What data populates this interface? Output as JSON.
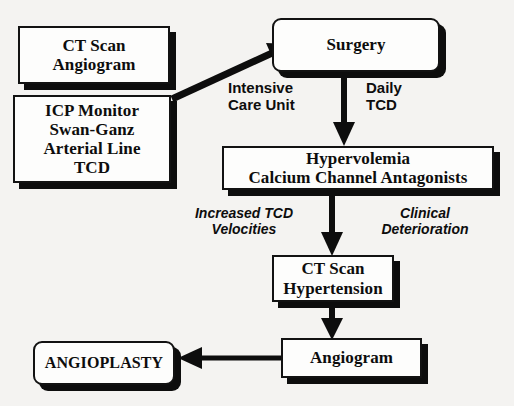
{
  "diagram": {
    "type": "flowchart",
    "background_color": "#f4f3f1",
    "ink_color": "#0d0d0d",
    "box_fill_color": "#fdfdfc"
  },
  "nodes": [
    {
      "id": "ct-scan-angiogram",
      "text": "CT Scan\nAngiogram",
      "shape": "rect",
      "font_size": 17
    },
    {
      "id": "icp-monitor",
      "text": "ICP Monitor\nSwan-Ganz\nArterial Line\nTCD",
      "shape": "rect",
      "font_size": 17
    },
    {
      "id": "surgery",
      "text": "Surgery",
      "shape": "rounded-rect",
      "font_size": 17
    },
    {
      "id": "hypervolemia",
      "text": "Hypervolemia\nCalcium Channel Antagonists",
      "shape": "rect",
      "font_size": 17
    },
    {
      "id": "ct-scan-hypertension",
      "text": "CT Scan\nHypertension",
      "shape": "rect",
      "font_size": 17
    },
    {
      "id": "angiogram",
      "text": "Angiogram",
      "shape": "rect",
      "font_size": 17
    },
    {
      "id": "angioplasty",
      "text": "ANGIOPLASTY",
      "shape": "rounded-rect",
      "font_size": 16
    }
  ],
  "edge_labels": [
    {
      "id": "intensive-care-unit",
      "text": "Intensive\nCare Unit",
      "style": "bold",
      "font_size": 15
    },
    {
      "id": "daily-tcd",
      "text": "Daily\nTCD",
      "style": "bold",
      "font_size": 15
    },
    {
      "id": "increased-tcd-velocities",
      "text": "Increased TCD\nVelocities",
      "style": "bold-italic",
      "font_size": 14
    },
    {
      "id": "clinical-deterioration",
      "text": "Clinical\nDeterioration",
      "style": "bold-italic",
      "font_size": 14
    }
  ],
  "edges": [
    {
      "id": "monitors-to-surgery",
      "from": "icp-monitor",
      "to": "surgery",
      "direction": "diagonal-up-right"
    },
    {
      "id": "surgery-to-hypervolemia",
      "from": "surgery",
      "to": "hypervolemia",
      "direction": "down"
    },
    {
      "id": "hypervolemia-to-ct-hypertension",
      "from": "hypervolemia",
      "to": "ct-scan-hypertension",
      "direction": "down"
    },
    {
      "id": "ct-hypertension-to-angiogram",
      "from": "ct-scan-hypertension",
      "to": "angiogram",
      "direction": "down"
    },
    {
      "id": "angiogram-to-angioplasty",
      "from": "angiogram",
      "to": "angioplasty",
      "direction": "left"
    }
  ]
}
